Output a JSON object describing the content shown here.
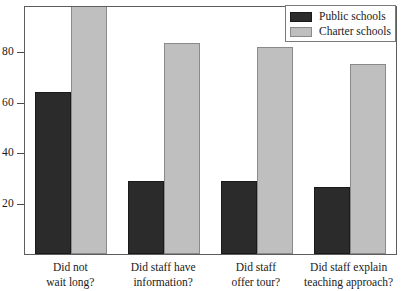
{
  "chart_data": {
    "type": "bar",
    "title": "",
    "subtitle": "",
    "xlabel": "",
    "ylabel": "",
    "grid": false,
    "legend_position": "top-right",
    "categories": [
      "Did not wait long?",
      "Did staff have information?",
      "Did staff offer tour?",
      "Did staff explain teaching approach?"
    ],
    "category_lines": [
      [
        "Did not",
        "wait long?"
      ],
      [
        "Did staff have",
        "information?"
      ],
      [
        "Did staff",
        "offer tour?"
      ],
      [
        "Did staff explain",
        "teaching approach?"
      ]
    ],
    "series": [
      {
        "name": "Public schools",
        "color": "#2b2b2b",
        "values": [
          63,
          28.5,
          28.5,
          26
        ]
      },
      {
        "name": "Charter schools",
        "color": "#bfbfbf",
        "values": [
          100,
          82,
          80.5,
          74
        ]
      }
    ],
    "ylim": [
      0,
      96
    ],
    "yticks": [
      20,
      40,
      60,
      80
    ],
    "ytick_labels": [
      "20",
      "40",
      "60",
      "80"
    ]
  },
  "legend": {
    "entries": [
      {
        "label": "Public schools",
        "swatch": "#2b2b2b"
      },
      {
        "label": "Charter schools",
        "swatch": "#bfbfbf"
      }
    ]
  },
  "axis": {
    "y_tick_labels": [
      "80",
      "60",
      "40",
      "20"
    ]
  }
}
